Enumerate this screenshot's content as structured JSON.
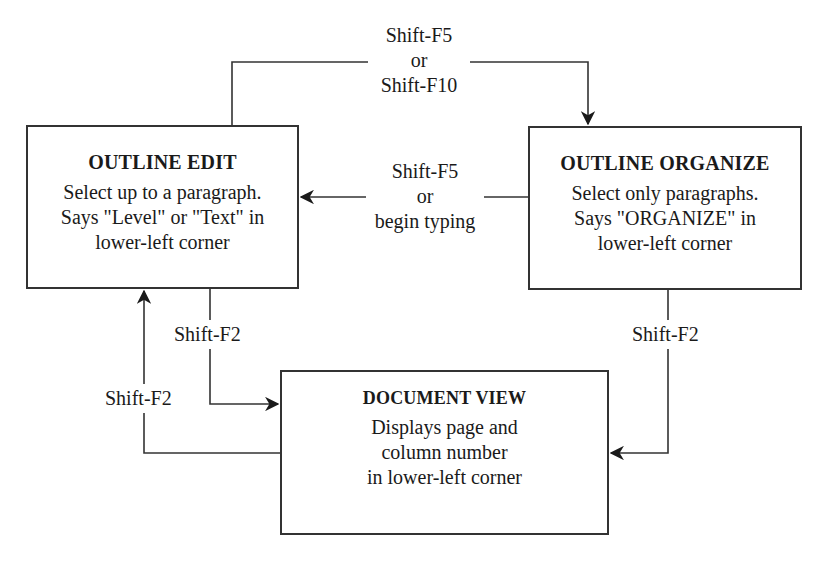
{
  "diagram": {
    "nodes": [
      {
        "id": "outline-edit",
        "title": "OUTLINE EDIT",
        "lines": [
          "Select up to a paragraph.",
          "Says \"Level\" or \"Text\" in",
          "lower-left corner"
        ]
      },
      {
        "id": "outline-organize",
        "title": "OUTLINE ORGANIZE",
        "lines": [
          "Select only paragraphs.",
          "Says \"ORGANIZE\" in",
          "lower-left corner"
        ]
      },
      {
        "id": "document-view",
        "title": "DOCUMENT VIEW",
        "lines": [
          "Displays page and",
          "column number",
          "in lower-left corner"
        ]
      }
    ],
    "edges": [
      {
        "from": "outline-edit",
        "to": "outline-organize",
        "label_lines": [
          "Shift-F5",
          "or",
          "Shift-F10"
        ]
      },
      {
        "from": "outline-organize",
        "to": "outline-edit",
        "label_lines": [
          "Shift-F5",
          "or",
          "begin typing"
        ]
      },
      {
        "from": "outline-edit",
        "to": "document-view",
        "label_lines": [
          "Shift-F2"
        ]
      },
      {
        "from": "document-view",
        "to": "outline-edit",
        "label_lines": [
          "Shift-F2"
        ]
      },
      {
        "from": "outline-organize",
        "to": "document-view",
        "label_lines": [
          "Shift-F2"
        ]
      }
    ]
  }
}
